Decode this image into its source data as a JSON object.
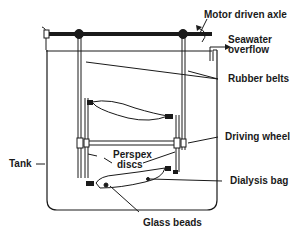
{
  "diagram": {
    "type": "apparatus-schematic",
    "labels": {
      "motor_axle": "Motor driven axle",
      "seawater_line1": "Seawater",
      "seawater_line2": "overflow",
      "rubber_belts": "Rubber belts",
      "driving_wheel": "Driving wheel",
      "perspex_line1": "Perspex",
      "perspex_line2": "discs",
      "tank": "Tank",
      "dialysis_bag": "Dialysis bag",
      "glass_beads": "Glass beads"
    },
    "colors": {
      "line": "#1a1a1a",
      "background": "#ffffff"
    }
  }
}
